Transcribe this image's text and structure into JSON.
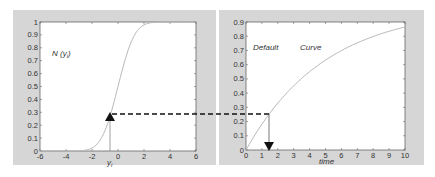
{
  "chart_data": [
    {
      "type": "line",
      "title": "",
      "annotation": "N (y_i)",
      "xlabel": "y_i",
      "ylabel": "",
      "xlim": [
        -6,
        6
      ],
      "ylim": [
        0,
        1
      ],
      "xticks": [
        "-6",
        "-4",
        "-2",
        "0",
        "2",
        "4",
        "6"
      ],
      "yticks": [
        "0",
        "0.1",
        "0.2",
        "0.3",
        "0.4",
        "0.5",
        "0.6",
        "0.7",
        "0.8",
        "0.9",
        "1"
      ],
      "grid": false,
      "series": [
        {
          "name": "N(y_i) cumulative normal",
          "x": [
            -6,
            -4,
            -3,
            -2,
            -1.5,
            -1,
            -0.62,
            0,
            0.5,
            1,
            1.5,
            2,
            3,
            4,
            6
          ],
          "y": [
            0,
            0,
            0.001,
            0.023,
            0.067,
            0.159,
            0.27,
            0.5,
            0.69,
            0.84,
            0.93,
            0.98,
            1,
            1,
            1
          ]
        }
      ],
      "marker": {
        "x": -0.62,
        "y": 0.27,
        "shape": "up-triangle"
      }
    },
    {
      "type": "line",
      "title": "",
      "annotation": [
        "Default",
        "Curve"
      ],
      "xlabel": "time",
      "ylabel": "",
      "xlim": [
        0,
        10
      ],
      "ylim": [
        0,
        0.9
      ],
      "xticks": [
        "0",
        "1",
        "2",
        "3",
        "4",
        "5",
        "6",
        "7",
        "8",
        "9",
        "10"
      ],
      "yticks": [
        "0",
        "0.1",
        "0.2",
        "0.3",
        "0.4",
        "0.5",
        "0.6",
        "0.7",
        "0.8",
        "0.9"
      ],
      "grid": false,
      "series": [
        {
          "name": "Default Curve",
          "x": [
            0,
            1,
            1.5,
            2,
            3,
            4,
            5,
            6,
            7,
            8,
            9,
            10
          ],
          "y": [
            0,
            0.18,
            0.26,
            0.33,
            0.45,
            0.55,
            0.63,
            0.7,
            0.76,
            0.8,
            0.84,
            0.865
          ]
        }
      ],
      "marker": {
        "x": 1.45,
        "y": 0.26,
        "shape": "down-triangle"
      }
    }
  ],
  "left_panel": {
    "annotation": "N (y",
    "annotation_sub": "i",
    "annotation_close": ")",
    "xlabel": "y",
    "xlabel_sub": "i",
    "xticks": [
      "-6",
      "-4",
      "-2",
      "0",
      "2",
      "4",
      "6"
    ],
    "yticks": [
      "0",
      "0.1",
      "0.2",
      "0.3",
      "0.4",
      "0.5",
      "0.6",
      "0.7",
      "0.8",
      "0.9",
      "1"
    ]
  },
  "right_panel": {
    "annotation_1": "Default",
    "annotation_2": "Curve",
    "xlabel": "time",
    "xticks": [
      "0",
      "1",
      "2",
      "3",
      "4",
      "5",
      "6",
      "7",
      "8",
      "9",
      "10"
    ],
    "yticks": [
      "0",
      "0.1",
      "0.2",
      "0.3",
      "0.4",
      "0.5",
      "0.6",
      "0.7",
      "0.8",
      "0.9"
    ]
  },
  "colors": {
    "panel_bg": "#d6d6d6",
    "plot_bg": "#ffffff",
    "curve": "#b8b8b8",
    "axis": "#555555",
    "marker": "#111111"
  }
}
